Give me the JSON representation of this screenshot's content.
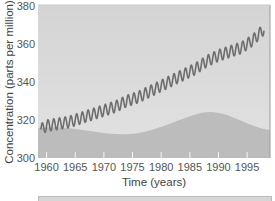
{
  "chart_data": {
    "type": "line",
    "title": "",
    "xlabel": "Time (years)",
    "ylabel": "Concentration (parts per million)",
    "xlim": [
      1958.5,
      1999
    ],
    "ylim": [
      300,
      380
    ],
    "x_ticks": [
      "1960",
      "1965",
      "1970",
      "1975",
      "1980",
      "1985",
      "1990",
      "1995"
    ],
    "y_ticks": [
      "300",
      "320",
      "340",
      "360",
      "380"
    ],
    "grid": false,
    "legend": null,
    "series": [
      {
        "name": "Atmospheric CO2 concentration",
        "color": "#6e6e6e",
        "seasonal_amplitude": 3,
        "x": [
          1959,
          1960,
          1962,
          1964,
          1966,
          1968,
          1970,
          1972,
          1974,
          1976,
          1978,
          1980,
          1982,
          1984,
          1986,
          1988,
          1990,
          1992,
          1994,
          1996,
          1998
        ],
        "values": [
          315,
          317,
          318,
          319,
          321,
          323,
          325,
          327,
          330,
          332,
          335,
          338,
          341,
          344,
          347,
          351,
          354,
          356,
          358,
          362,
          368
        ]
      }
    ],
    "background": {
      "sky_color": "#dcdcdc",
      "hill_color": "#bdbdbd"
    }
  }
}
